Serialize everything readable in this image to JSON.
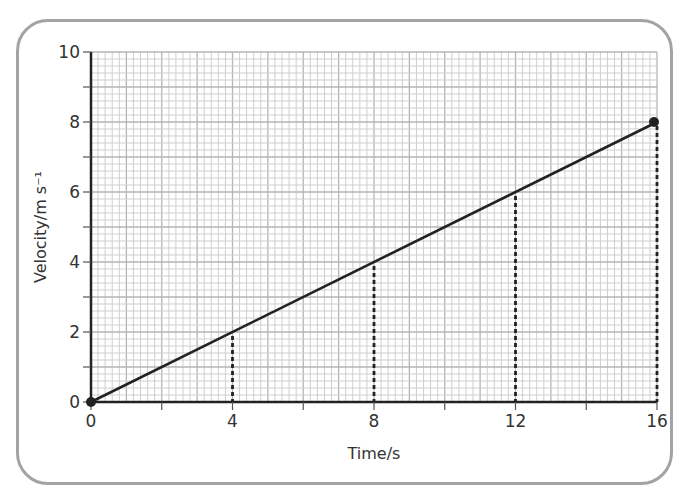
{
  "chart_data": {
    "type": "line",
    "title": "",
    "xlabel": "Time/s",
    "ylabel": "Velocity/m s⁻¹",
    "xlim": [
      0,
      16
    ],
    "ylim": [
      0,
      10
    ],
    "x_ticks": [
      0,
      4,
      8,
      12,
      16
    ],
    "x_minor_ticks": [
      2,
      6,
      10,
      14
    ],
    "y_ticks": [
      0,
      2,
      4,
      6,
      8,
      10
    ],
    "y_minor_ticks": [
      1,
      3,
      5,
      7,
      9
    ],
    "grid": {
      "on": true,
      "fine_step": 0.2,
      "major_step": 1
    },
    "series": [
      {
        "name": "velocity",
        "x": [
          0,
          16
        ],
        "y": [
          0,
          8
        ],
        "markers_at": [
          [
            0,
            0
          ],
          [
            16,
            8
          ]
        ]
      }
    ],
    "annotations": {
      "dashed_drop_lines": [
        {
          "x": 4,
          "y": 2
        },
        {
          "x": 8,
          "y": 4
        },
        {
          "x": 12,
          "y": 6
        },
        {
          "x": 16,
          "y": 8
        }
      ]
    },
    "colors": {
      "line": "#222222",
      "grid_fine": "#cfcfcf",
      "grid_major": "#b5b5b5",
      "frame": "#a3a3a3",
      "text": "#333333"
    }
  }
}
